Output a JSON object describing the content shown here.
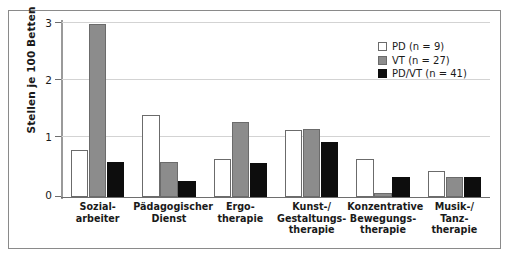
{
  "chart_data": {
    "type": "bar",
    "title": "",
    "xlabel": "",
    "ylabel": "Stellen je 100 Betten",
    "ylim": [
      0,
      3
    ],
    "yticks": [
      0,
      1,
      2,
      3
    ],
    "ytick_labels": [
      "0",
      "1",
      "2",
      "3"
    ],
    "grid": true,
    "grid_axis": "y",
    "legend_position": "top-right",
    "categories": [
      "Sozial-\narbeiter",
      "Pädagogischer\nDienst",
      "Ergo-\ntherapie",
      "Kunst-/\nGestaltungs-\ntherapie",
      "Konzentrative\nBewegungs-\ntherapie",
      "Musik-/\nTanz-\ntherapie"
    ],
    "series": [
      {
        "name": "PD (n = 9)",
        "key": "pd",
        "color": "#ffffff",
        "edge_color": "#6b6b6b",
        "values": [
          0.8,
          1.4,
          0.65,
          1.15,
          0.65,
          0.45
        ]
      },
      {
        "name": "VT (n = 27)",
        "key": "vt",
        "color": "#8c8c8c",
        "edge_color": "#6b6b6b",
        "values": [
          2.97,
          0.6,
          1.28,
          1.17,
          0.07,
          0.35
        ]
      },
      {
        "name": "PD/VT (n = 41)",
        "key": "pdvt",
        "color": "#0d0d0d",
        "edge_color": "#0d0d0d",
        "values": [
          0.6,
          0.28,
          0.58,
          0.95,
          0.35,
          0.35
        ]
      }
    ]
  },
  "legend": {
    "items": [
      {
        "label": "PD (n = 9)",
        "swatch": "pd"
      },
      {
        "label": "VT (n = 27)",
        "swatch": "vt"
      },
      {
        "label": "PD/VT (n = 41)",
        "swatch": "pdvt"
      }
    ]
  },
  "axis": {
    "y_title": "Stellen je 100 Betten",
    "y_tick_labels": [
      "3",
      "2",
      "1",
      "0"
    ]
  }
}
